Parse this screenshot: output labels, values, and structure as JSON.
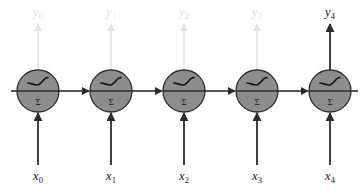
{
  "figure": {
    "type": "neural-network-diagram",
    "width": 364,
    "height": 192,
    "background_color": "#ffffff"
  },
  "style": {
    "node_fill": "#8d8d8d",
    "node_stroke": "#2b2b2b",
    "active_line_color": "#2b2b2b",
    "faded_line_color": "#e2e2e2",
    "active_text_color": "#1a1a1a",
    "faded_text_color": "#e0e0e0",
    "node_radius": 21,
    "node_diameter": 42
  },
  "nodes": [
    {
      "id": "node-0",
      "cx": 38,
      "cy": 91,
      "activation_icon": "sigmoid-curve-icon",
      "sum_symbol": "Σ"
    },
    {
      "id": "node-1",
      "cx": 111,
      "cy": 91,
      "activation_icon": "sigmoid-curve-icon",
      "sum_symbol": "Σ"
    },
    {
      "id": "node-2",
      "cx": 184,
      "cy": 91,
      "activation_icon": "sigmoid-curve-icon",
      "sum_symbol": "Σ"
    },
    {
      "id": "node-3",
      "cx": 257,
      "cy": 91,
      "activation_icon": "sigmoid-curve-icon",
      "sum_symbol": "Σ"
    },
    {
      "id": "node-4",
      "cx": 330,
      "cy": 91,
      "activation_icon": "sigmoid-curve-icon",
      "sum_symbol": "Σ"
    }
  ],
  "inputs": [
    {
      "id": "input-0",
      "base": "x",
      "subscript": "0",
      "x": 38,
      "label_y": 180,
      "active": true
    },
    {
      "id": "input-1",
      "base": "x",
      "subscript": "1",
      "x": 111,
      "label_y": 180,
      "active": true
    },
    {
      "id": "input-2",
      "base": "x",
      "subscript": "2",
      "x": 184,
      "label_y": 180,
      "active": true
    },
    {
      "id": "input-3",
      "base": "x",
      "subscript": "3",
      "x": 257,
      "label_y": 180,
      "active": true
    },
    {
      "id": "input-4",
      "base": "x",
      "subscript": "4",
      "x": 330,
      "label_y": 180,
      "active": true
    }
  ],
  "outputs": [
    {
      "id": "output-0",
      "base": "y",
      "subscript": "0",
      "x": 38,
      "label_y": 16,
      "active": false
    },
    {
      "id": "output-1",
      "base": "y",
      "subscript": "1",
      "x": 111,
      "label_y": 16,
      "active": false
    },
    {
      "id": "output-2",
      "base": "y",
      "subscript": "2",
      "x": 184,
      "label_y": 16,
      "active": false
    },
    {
      "id": "output-3",
      "base": "y",
      "subscript": "3",
      "x": 257,
      "label_y": 16,
      "active": false
    },
    {
      "id": "output-4",
      "base": "y",
      "subscript": "4",
      "x": 330,
      "label_y": 16,
      "active": true
    }
  ],
  "recurrent_connections": [
    {
      "id": "link-0-1",
      "from": "node-0",
      "to": "node-1",
      "y": 91
    },
    {
      "id": "link-1-2",
      "from": "node-1",
      "to": "node-2",
      "y": 91
    },
    {
      "id": "link-2-3",
      "from": "node-2",
      "to": "node-3",
      "y": 91
    },
    {
      "id": "link-3-4",
      "from": "node-3",
      "to": "node-4",
      "y": 91
    }
  ]
}
